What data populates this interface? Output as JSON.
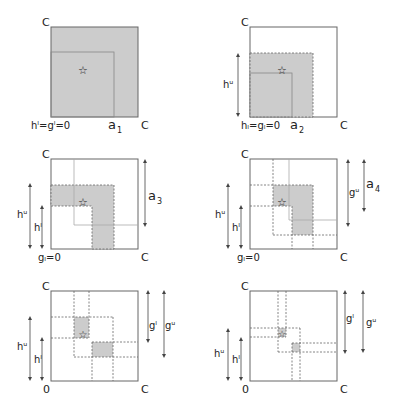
{
  "figure": {
    "panels": [
      {
        "id": "a1",
        "top_label": "C",
        "bottom_left_label": "hˡ=gˡ=0",
        "bottom_mid_label": "a",
        "bottom_mid_sub": "1",
        "bottom_right_label": "C"
      },
      {
        "id": "a2",
        "top_label": "C",
        "bottom_left_label": "hₗ=gₗ=0",
        "bottom_mid_label": "a",
        "bottom_mid_sub": "2",
        "bottom_right_label": "C",
        "left_arrow_label": "hᵘ"
      },
      {
        "id": "a3",
        "top_label": "C",
        "bottom_left_label": "gₗ=0",
        "bottom_right_label": "C",
        "left_arrow_outer": "hᵘ",
        "left_arrow_inner": "hˡ",
        "right_arrow_label": "a",
        "right_arrow_sub": "3"
      },
      {
        "id": "a4",
        "top_label": "C",
        "bottom_left_label": "gₗ=0",
        "bottom_right_label": "C",
        "left_arrow_outer": "hᵘ",
        "left_arrow_inner": "hˡ",
        "right_arrow_1": "gᵘ",
        "right_arrow_2": "a",
        "right_arrow_2_sub": "4"
      },
      {
        "id": "a5",
        "top_label": "C",
        "bottom_left_label": "0",
        "bottom_right_label": "C",
        "left_arrow_outer": "hᵘ",
        "left_arrow_inner": "hˡ",
        "right_arrow_1": "gˡ",
        "right_arrow_2": "gᵘ"
      },
      {
        "id": "a6",
        "top_label": "C",
        "bottom_left_label": "0",
        "bottom_right_label": "C",
        "left_arrow_outer": "hᵘ",
        "left_arrow_inner": "hˡ",
        "right_arrow_1": "gˡ",
        "right_arrow_2": "gᵘ"
      }
    ],
    "marker_symbol": "☆",
    "colors": {
      "shade": "#cccccc",
      "line": "#666666",
      "thin_line": "#aaaaaa",
      "text": "#222222"
    }
  }
}
